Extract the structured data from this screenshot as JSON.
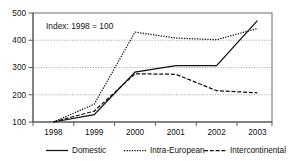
{
  "chart_data": {
    "type": "line",
    "title": "",
    "annotation": "Index: 1998 = 100",
    "xlabel": "",
    "ylabel": "",
    "categories": [
      "1998",
      "1999",
      "2000",
      "2001",
      "2002",
      "2003"
    ],
    "x_tick_labels": [
      "1998",
      "1999",
      "2000",
      "2001",
      "2002",
      "2003"
    ],
    "y_tick_labels": [
      "100",
      "200",
      "300",
      "400",
      "500"
    ],
    "y_ticks": [
      100,
      200,
      300,
      400,
      500
    ],
    "ylim": [
      100,
      500
    ],
    "grid": "horizontal-dotted",
    "legend_position": "bottom",
    "series": [
      {
        "name": "Domestic",
        "style": "solid",
        "values": [
          100,
          127,
          283,
          307,
          307,
          472
        ]
      },
      {
        "name": "Intra-European",
        "style": "dotted",
        "values": [
          100,
          165,
          430,
          408,
          402,
          443
        ]
      },
      {
        "name": "Intercontinental",
        "style": "dashed",
        "values": [
          100,
          140,
          277,
          275,
          215,
          207
        ]
      }
    ]
  },
  "legend": {
    "items": [
      {
        "label": "Domestic"
      },
      {
        "label": "Intra-European"
      },
      {
        "label": "Intercontinental"
      }
    ]
  }
}
